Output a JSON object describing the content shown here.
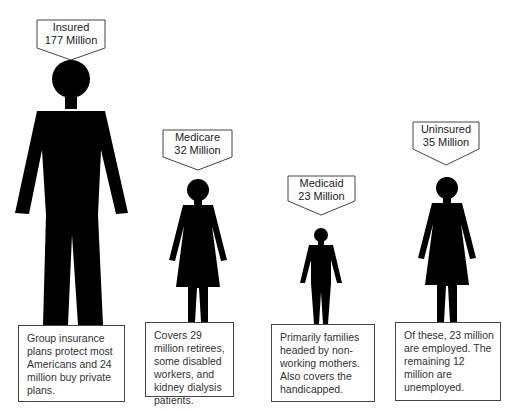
{
  "groups": [
    {
      "id": "insured",
      "title": "Insured",
      "count": "177 Million",
      "description": "Group insurance plans protect most Americans and 24 million buy private plans.",
      "figure": "man"
    },
    {
      "id": "medicare",
      "title": "Medicare",
      "count": "32 Million",
      "description": "Covers 29 million retirees, some disabled workers, and kidney dialysis patients.",
      "figure": "woman"
    },
    {
      "id": "medicaid",
      "title": "Medicaid",
      "count": "23 Million",
      "description": "Primarily families headed by non-working mothers. Also covers the handicapped.",
      "figure": "child"
    },
    {
      "id": "uninsured",
      "title": "Uninsured",
      "count": "35 Million",
      "description": "Of these, 23 million are employed. The remaining 12 million are unemployed.",
      "figure": "woman"
    }
  ],
  "colors": {
    "figure": "#000000",
    "border": "#444444",
    "text": "#222222"
  }
}
